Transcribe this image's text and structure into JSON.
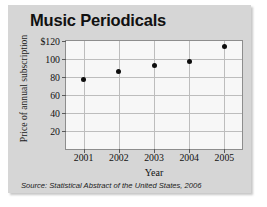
{
  "chart_data": {
    "type": "scatter",
    "title": "Music Periodicals",
    "xlabel": "Year",
    "ylabel": "Price of annual subscription",
    "categories": [
      "2001",
      "2002",
      "2003",
      "2004",
      "2005"
    ],
    "x": [
      2001,
      2002,
      2003,
      2004,
      2005
    ],
    "values": [
      77,
      86,
      93,
      97,
      114
    ],
    "series": [
      {
        "name": "Price of annual subscription",
        "values": [
          77,
          86,
          93,
          97,
          114
        ]
      }
    ],
    "ylim": [
      0,
      120
    ],
    "xlim": [
      2000.5,
      2005.5
    ],
    "yticks": [
      20,
      40,
      60,
      80,
      100,
      120
    ],
    "ytick_labels": [
      "20",
      "40",
      "60",
      "80",
      "100",
      "$120"
    ],
    "xtick_labels": [
      "2001",
      "2002",
      "2003",
      "2004",
      "2005"
    ],
    "grid": true,
    "legend": "none",
    "marker_color": "#0d0d0d",
    "plot_background": "#f7f7f7",
    "figure_background": "#d6d6d6",
    "gridline_color": "#bdbdbd"
  },
  "source": {
    "text": "Source: Statistical Abstract of the United States, 2006"
  }
}
